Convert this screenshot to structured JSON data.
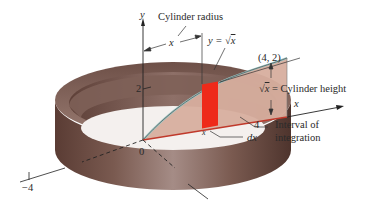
{
  "figure": {
    "labels": {
      "y_axis": "y",
      "x_axis": "x",
      "cylinder_radius": "Cylinder radius",
      "radius_var": "x",
      "curve_lhs": "y = ",
      "curve_rad": "x",
      "point": "(4, 2)",
      "height_rad": "x",
      "height_text": " = Cylinder height",
      "tick_2": "2",
      "tick_4": "4",
      "tick_neg4": "−4",
      "origin": "0",
      "dx": "dx",
      "interval_line1": "Interval of",
      "interval_line2": "integration",
      "x_small": "x"
    },
    "colors": {
      "shell_dark": "#5a3e36",
      "shell_mid": "#8a6a60",
      "shell_light": "#b89a90",
      "region_fill": "#d9b2a2",
      "region_top": "#a8c8c8",
      "strip_red": "#ee2a1a",
      "axis_red": "#c0392b",
      "axis": "#222222"
    }
  }
}
